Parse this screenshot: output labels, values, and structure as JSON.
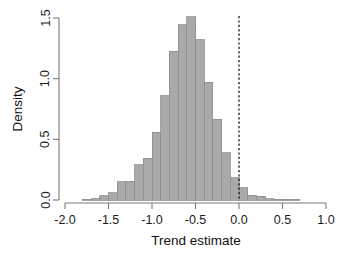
{
  "chart_data": {
    "type": "bar",
    "title": "",
    "subtitle": "",
    "xlabel": "Trend estimate",
    "ylabel": "Density",
    "xlim": [
      -2.0,
      1.0
    ],
    "ylim": [
      0.0,
      1.55
    ],
    "xticks": [
      -2.0,
      -1.5,
      -1.0,
      -0.5,
      0.0,
      0.5,
      1.0
    ],
    "xticklabels": [
      "-2.0",
      "-1.5",
      "-1.0",
      "-0.5",
      "0.0",
      "0.5",
      "1.0"
    ],
    "yticks": [
      0.0,
      0.5,
      1.0,
      1.5
    ],
    "yticklabels": [
      "0.0",
      "0.5",
      "1.0",
      "1.5"
    ],
    "grid": false,
    "legend": null,
    "bin_width": 0.1,
    "bar_fill": "#a9a9a9",
    "bar_edge": "#8d8d8d",
    "annotations": [
      {
        "kind": "vertical-reference-line",
        "x": 0.0,
        "style": "dotted",
        "color": "#1a1a1a"
      }
    ],
    "bins": [
      {
        "x0": -1.8,
        "x1": -1.7,
        "value": 0.005
      },
      {
        "x0": -1.7,
        "x1": -1.6,
        "value": 0.01
      },
      {
        "x0": -1.6,
        "x1": -1.5,
        "value": 0.035
      },
      {
        "x0": -1.5,
        "x1": -1.4,
        "value": 0.06
      },
      {
        "x0": -1.4,
        "x1": -1.3,
        "value": 0.15
      },
      {
        "x0": -1.3,
        "x1": -1.2,
        "value": 0.155
      },
      {
        "x0": -1.2,
        "x1": -1.1,
        "value": 0.29
      },
      {
        "x0": -1.1,
        "x1": -1.0,
        "value": 0.345
      },
      {
        "x0": -1.0,
        "x1": -0.9,
        "value": 0.56
      },
      {
        "x0": -0.9,
        "x1": -0.8,
        "value": 0.86
      },
      {
        "x0": -0.8,
        "x1": -0.7,
        "value": 1.225
      },
      {
        "x0": -0.7,
        "x1": -0.6,
        "value": 1.445
      },
      {
        "x0": -0.6,
        "x1": -0.5,
        "value": 1.51
      },
      {
        "x0": -0.5,
        "x1": -0.4,
        "value": 1.32
      },
      {
        "x0": -0.4,
        "x1": -0.3,
        "value": 0.97
      },
      {
        "x0": -0.3,
        "x1": -0.2,
        "value": 0.665
      },
      {
        "x0": -0.2,
        "x1": -0.1,
        "value": 0.39
      },
      {
        "x0": -0.1,
        "x1": 0.0,
        "value": 0.185
      },
      {
        "x0": 0.0,
        "x1": 0.1,
        "value": 0.1
      },
      {
        "x0": 0.1,
        "x1": 0.2,
        "value": 0.04
      },
      {
        "x0": 0.2,
        "x1": 0.3,
        "value": 0.03
      },
      {
        "x0": 0.3,
        "x1": 0.4,
        "value": 0.012
      },
      {
        "x0": 0.4,
        "x1": 0.5,
        "value": 0.008
      },
      {
        "x0": 0.5,
        "x1": 0.6,
        "value": 0.005
      },
      {
        "x0": 0.6,
        "x1": 0.7,
        "value": 0.004
      }
    ]
  }
}
